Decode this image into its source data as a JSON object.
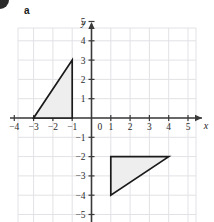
{
  "figure": {
    "part_label": "a",
    "corner_mark": "bullet-mark"
  },
  "axes": {
    "x_label": "x",
    "y_label": "y",
    "origin_label": "0",
    "x_ticks": [
      "−5",
      "−4",
      "−3",
      "−2",
      "−1",
      "1",
      "2",
      "3",
      "4",
      "5"
    ],
    "y_ticks": [
      "5",
      "4",
      "3",
      "2",
      "1",
      "−1",
      "−2",
      "−3",
      "−4",
      "−5"
    ],
    "x_range": [
      -5.5,
      5.7
    ],
    "y_range": [
      -5.2,
      5.6
    ],
    "grid": true,
    "grid_color": "#e2e2e6",
    "axis_color": "#3a3a3a"
  },
  "chart_data": {
    "type": "scatter",
    "title": "",
    "xlabel": "x",
    "ylabel": "y",
    "xlim": [
      -5.5,
      5.7
    ],
    "ylim": [
      -5.2,
      5.6
    ],
    "grid": true,
    "shapes": [
      {
        "name": "triangle-upper-left",
        "type": "polygon",
        "vertices": [
          [
            -3,
            0
          ],
          [
            -1,
            0
          ],
          [
            -1,
            3
          ]
        ],
        "fill": "#eeeeee",
        "stroke": "#1a1a1a"
      },
      {
        "name": "triangle-lower-right",
        "type": "polygon",
        "vertices": [
          [
            1,
            -2
          ],
          [
            4,
            -2
          ],
          [
            1,
            -4
          ]
        ],
        "fill": "#eeeeee",
        "stroke": "#1a1a1a"
      }
    ]
  }
}
